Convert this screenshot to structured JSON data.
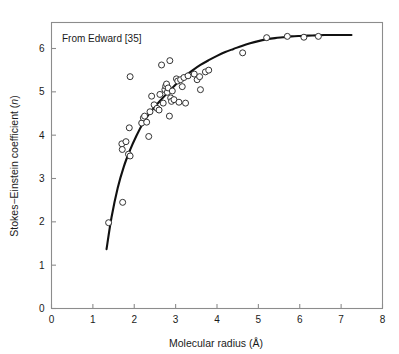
{
  "figure": {
    "annotation": "From Edward [35]",
    "background_color": "#ffffff",
    "frame_color": "#8c8c8c",
    "curve_color": "#111111",
    "marker_edge_color": "#333333",
    "marker_face_color": "#ffffff"
  },
  "axes": {
    "x_title_main": "Molecular radius (",
    "x_title_unit": "Å",
    "x_title_close": ")",
    "x_title_full": "Molecular radius (Å)",
    "y_title_main": "Stokes−Einstein coefficient (",
    "y_title_symbol": "n",
    "y_title_close": ")",
    "y_title_full": "Stokes−Einstein coefficient (n)",
    "x_ticks": [
      "0",
      "1",
      "2",
      "3",
      "4",
      "5",
      "6",
      "7",
      "8"
    ],
    "y_ticks": [
      "0",
      "1",
      "2",
      "3",
      "4",
      "5",
      "6"
    ]
  },
  "chart_data": {
    "type": "scatter",
    "title": "",
    "subtitle": "",
    "annotation": "From Edward [35]",
    "xlabel": "Molecular radius (Å)",
    "ylabel": "Stokes−Einstein coefficient (n)",
    "xlim": [
      0,
      8
    ],
    "ylim": [
      0,
      6.6
    ],
    "x_ticks": [
      0,
      1,
      2,
      3,
      4,
      5,
      6,
      7,
      8
    ],
    "y_ticks": [
      0,
      1,
      2,
      3,
      4,
      5,
      6
    ],
    "grid": false,
    "legend": null,
    "series": [
      {
        "name": "Measured molecules",
        "marker": "open-circle",
        "points": [
          [
            1.38,
            1.98
          ],
          [
            1.72,
            2.45
          ],
          [
            1.7,
            3.8
          ],
          [
            1.71,
            3.67
          ],
          [
            1.8,
            3.85
          ],
          [
            1.86,
            3.56
          ],
          [
            1.9,
            3.52
          ],
          [
            1.88,
            4.17
          ],
          [
            1.9,
            5.35
          ],
          [
            2.18,
            4.28
          ],
          [
            2.22,
            4.4
          ],
          [
            2.25,
            4.44
          ],
          [
            2.3,
            4.3
          ],
          [
            2.35,
            3.97
          ],
          [
            2.38,
            4.54
          ],
          [
            2.42,
            4.9
          ],
          [
            2.48,
            4.7
          ],
          [
            2.55,
            4.62
          ],
          [
            2.6,
            4.58
          ],
          [
            2.62,
            4.94
          ],
          [
            2.66,
            5.62
          ],
          [
            2.7,
            4.74
          ],
          [
            2.74,
            5.05
          ],
          [
            2.76,
            5.13
          ],
          [
            2.78,
            5.18
          ],
          [
            2.8,
            4.99
          ],
          [
            2.82,
            5.09
          ],
          [
            2.85,
            4.44
          ],
          [
            2.86,
            5.72
          ],
          [
            2.88,
            4.86
          ],
          [
            2.9,
            4.78
          ],
          [
            2.92,
            5.02
          ],
          [
            2.96,
            4.82
          ],
          [
            3.02,
            5.3
          ],
          [
            3.05,
            5.25
          ],
          [
            3.08,
            4.76
          ],
          [
            3.12,
            5.28
          ],
          [
            3.16,
            5.12
          ],
          [
            3.2,
            5.33
          ],
          [
            3.24,
            4.74
          ],
          [
            3.3,
            5.37
          ],
          [
            3.45,
            5.41
          ],
          [
            3.52,
            5.28
          ],
          [
            3.58,
            5.35
          ],
          [
            3.6,
            5.05
          ],
          [
            3.72,
            5.46
          ],
          [
            3.8,
            5.5
          ],
          [
            4.62,
            5.9
          ],
          [
            5.2,
            6.25
          ],
          [
            5.7,
            6.28
          ],
          [
            6.1,
            6.26
          ],
          [
            6.45,
            6.28
          ]
        ]
      }
    ],
    "fit_curve": {
      "name": "Stokes-Einstein fit",
      "style": "solid",
      "x_start": 1.33,
      "x_end": 7.25,
      "points": [
        [
          1.33,
          1.37
        ],
        [
          1.45,
          2.1
        ],
        [
          1.6,
          2.78
        ],
        [
          1.75,
          3.28
        ],
        [
          1.9,
          3.66
        ],
        [
          2.05,
          3.98
        ],
        [
          2.2,
          4.26
        ],
        [
          2.35,
          4.48
        ],
        [
          2.5,
          4.66
        ],
        [
          2.65,
          4.82
        ],
        [
          2.8,
          4.97
        ],
        [
          2.95,
          5.12
        ],
        [
          3.1,
          5.26
        ],
        [
          3.25,
          5.38
        ],
        [
          3.4,
          5.49
        ],
        [
          3.6,
          5.62
        ],
        [
          3.8,
          5.73
        ],
        [
          4.0,
          5.83
        ],
        [
          4.2,
          5.92
        ],
        [
          4.4,
          5.99
        ],
        [
          4.6,
          6.06
        ],
        [
          4.8,
          6.12
        ],
        [
          5.0,
          6.17
        ],
        [
          5.2,
          6.21
        ],
        [
          5.4,
          6.24
        ],
        [
          5.6,
          6.26
        ],
        [
          5.8,
          6.28
        ],
        [
          6.0,
          6.29
        ],
        [
          6.3,
          6.3
        ],
        [
          6.6,
          6.31
        ],
        [
          7.0,
          6.31
        ],
        [
          7.25,
          6.31
        ]
      ]
    }
  }
}
